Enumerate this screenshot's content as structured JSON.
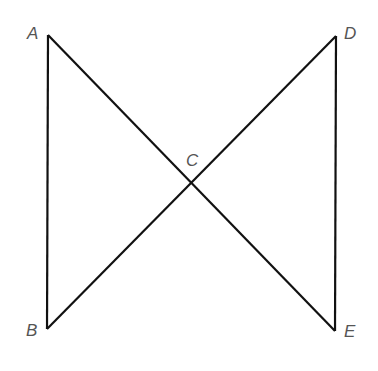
{
  "diagram": {
    "stroke_color": "#111111",
    "label_color": "#555555",
    "points": {
      "A": {
        "label": "A",
        "x": 48,
        "y": 35
      },
      "B": {
        "label": "B",
        "x": 47,
        "y": 329
      },
      "C": {
        "label": "C",
        "x": 190,
        "y": 181
      },
      "D": {
        "label": "D",
        "x": 336,
        "y": 36
      },
      "E": {
        "label": "E",
        "x": 335,
        "y": 331
      }
    },
    "segments": [
      "AB",
      "AE",
      "BD",
      "DE"
    ]
  }
}
